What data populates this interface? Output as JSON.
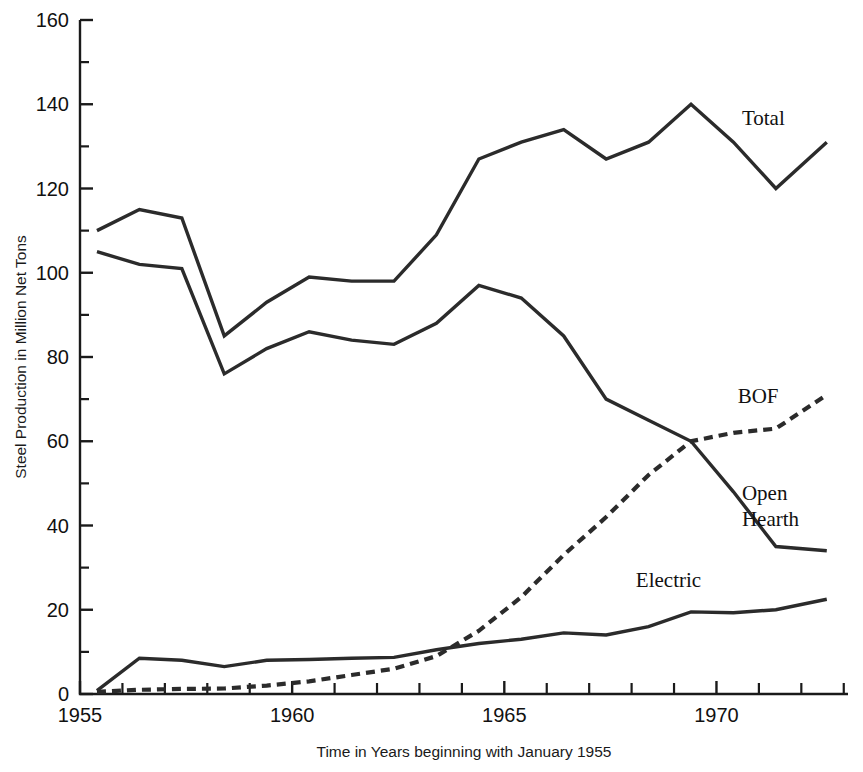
{
  "chart_data": {
    "type": "line",
    "title": "",
    "xlabel": "Time in Years beginning with January 1955",
    "ylabel": "Steel Production in Million Net Tons",
    "xlim": [
      1955,
      1973.1
    ],
    "ylim": [
      0,
      160
    ],
    "grid": false,
    "legend_position": "inline-right-of-series",
    "x_tick_labels": [
      "1955",
      "1960",
      "1965",
      "1970"
    ],
    "x_tick_values": [
      1955,
      1960,
      1965,
      1970
    ],
    "x_minor_tick_interval": 1,
    "y_tick_labels": [
      "0",
      "20",
      "40",
      "60",
      "80",
      "100",
      "120",
      "140",
      "160"
    ],
    "y_tick_values": [
      0,
      20,
      40,
      60,
      80,
      100,
      120,
      140,
      160
    ],
    "y_minor_tick_interval": 10,
    "series": [
      {
        "name": "Total",
        "label": "Total",
        "style": "solid",
        "label_x": 1970.6,
        "label_y": 135,
        "x": [
          1955.4,
          1956.4,
          1957.4,
          1958.4,
          1959.4,
          1960.4,
          1961.4,
          1962.4,
          1963.4,
          1964.4,
          1965.4,
          1966.4,
          1967.4,
          1968.4,
          1969.4,
          1970.4,
          1971.4,
          1972.6
        ],
        "y": [
          110,
          115,
          113,
          85,
          93,
          99,
          98,
          98,
          109,
          127,
          131,
          134,
          127,
          131,
          140,
          131,
          120,
          131
        ]
      },
      {
        "name": "Open Hearth",
        "label": "Open Hearth",
        "style": "solid",
        "label_x": 1970.6,
        "label_y": 46,
        "x": [
          1955.4,
          1956.4,
          1957.4,
          1958.4,
          1959.4,
          1960.4,
          1961.4,
          1962.4,
          1963.4,
          1964.4,
          1965.4,
          1966.4,
          1967.4,
          1968.4,
          1969.4,
          1970.4,
          1971.4,
          1972.6
        ],
        "y": [
          105,
          102,
          101,
          76,
          82,
          86,
          84,
          83,
          88,
          97,
          94,
          85,
          70,
          65,
          60,
          48,
          35,
          34
        ]
      },
      {
        "name": "BOF",
        "label": "BOF",
        "style": "dashed",
        "label_x": 1970.5,
        "label_y": 69,
        "x": [
          1955.4,
          1956.4,
          1957.4,
          1958.4,
          1959.4,
          1960.4,
          1961.4,
          1962.4,
          1963.4,
          1964.4,
          1965.4,
          1966.4,
          1967.4,
          1968.4,
          1969.4,
          1970.4,
          1971.4,
          1972.6
        ],
        "y": [
          0.5,
          1,
          1.2,
          1.3,
          2,
          3,
          4.5,
          6,
          9,
          15,
          23,
          33,
          42,
          52,
          60,
          62,
          63,
          71
        ]
      },
      {
        "name": "Electric",
        "label": "Electric",
        "style": "solid",
        "label_x": 1968.1,
        "label_y": 25.5,
        "x": [
          1955.4,
          1956.4,
          1957.4,
          1958.4,
          1959.4,
          1960.4,
          1961.4,
          1962.4,
          1963.4,
          1964.4,
          1965.4,
          1966.4,
          1967.4,
          1968.4,
          1969.4,
          1970.4,
          1971.4,
          1972.6
        ],
        "y": [
          0.8,
          8.5,
          8,
          6.5,
          8,
          8.2,
          8.5,
          8.7,
          10.5,
          12,
          13,
          14.5,
          14,
          16,
          19.5,
          19.3,
          20,
          22.5
        ]
      }
    ]
  },
  "axis": {
    "y_title": "Steel Production in Million Net Tons",
    "x_title": "Time in Years beginning with January 1955"
  }
}
